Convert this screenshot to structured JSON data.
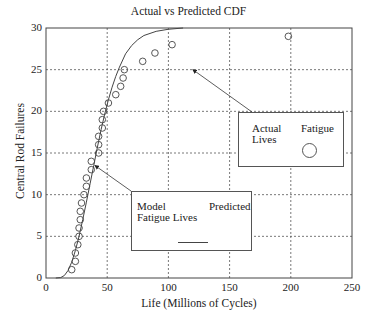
{
  "chart_data": {
    "type": "scatter",
    "title": "Actual vs Predicted CDF",
    "xlabel": "Life (Millions of Cycles)",
    "ylabel": "Central Rod Failures",
    "xlim": [
      0,
      250
    ],
    "ylim": [
      0,
      30
    ],
    "xticks": [
      0,
      50,
      100,
      150,
      200,
      250
    ],
    "yticks": [
      0,
      5,
      10,
      15,
      20,
      25,
      30
    ],
    "grid": true,
    "series": [
      {
        "name": "Actual Fatigue Lives",
        "style": "circle-markers",
        "x": [
          21,
          24,
          24,
          26,
          27,
          27,
          28,
          28,
          29,
          31,
          33,
          33,
          37,
          37,
          43,
          43,
          43,
          46,
          46,
          47,
          51,
          57,
          61,
          63,
          64,
          79,
          89,
          103,
          198
        ],
        "y": [
          1,
          2,
          3,
          4,
          5,
          6,
          7,
          8,
          9,
          10,
          11,
          12,
          13,
          14,
          15,
          16,
          17,
          18,
          19,
          20,
          21,
          22,
          23,
          24,
          25,
          26,
          27,
          28,
          29
        ]
      },
      {
        "name": "Model Predicted Fatigue Lives",
        "style": "solid-line",
        "x": [
          8,
          12,
          15,
          18,
          21,
          24,
          27,
          30,
          33,
          36,
          39,
          42,
          45,
          48,
          51,
          54,
          57,
          60,
          65,
          70,
          75,
          80,
          90,
          100,
          112
        ],
        "y": [
          0,
          0.05,
          0.3,
          0.9,
          1.9,
          3.3,
          5.0,
          7.0,
          9.1,
          11.3,
          13.5,
          15.7,
          17.8,
          19.7,
          21.4,
          22.9,
          24.2,
          25.3,
          26.9,
          27.9,
          28.6,
          29.1,
          29.6,
          29.85,
          30
        ]
      }
    ],
    "annotations": [
      {
        "text": [
          "Actual",
          "Lives",
          "Fatigue"
        ],
        "arrow_to": [
          120,
          25
        ],
        "marker": "circle"
      },
      {
        "text": [
          "Model",
          "Fatigue Lives",
          "Predicted"
        ],
        "arrow_to": [
          40,
          13.5
        ],
        "marker": "line"
      }
    ]
  },
  "labels": {
    "title": "Actual vs Predicted CDF",
    "xlabel": "Life (Millions of Cycles)",
    "ylabel": "Central Rod Failures",
    "xticks": [
      "0",
      "50",
      "100",
      "150",
      "200",
      "250"
    ],
    "yticks": [
      "0",
      "5",
      "10",
      "15",
      "20",
      "25",
      "30"
    ],
    "legend_actual": {
      "line1": "Actual",
      "line2": "Lives",
      "right": "Fatigue"
    },
    "legend_model": {
      "line1": "Model",
      "line2": "Fatigue Lives",
      "right": "Predicted"
    }
  }
}
